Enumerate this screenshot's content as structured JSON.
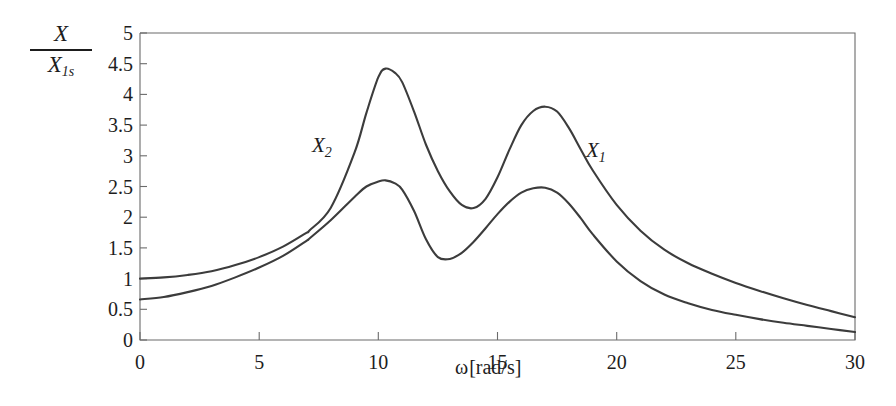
{
  "figure": {
    "ylabel_numerator": "X",
    "ylabel_denominator_base": "X",
    "ylabel_denominator_sub": "1s",
    "xlabel": "ω[rad/s]",
    "xlabel_symbol": "ω",
    "xlabel_unit": "[rad/s]"
  },
  "series_labels": {
    "x1_base": "X",
    "x1_sub": "1",
    "x2_base": "X",
    "x2_sub": "2"
  },
  "chart_data": {
    "type": "line",
    "title": "",
    "xlabel": "ω[rad/s]",
    "ylabel": "X/X1s",
    "xlim": [
      0,
      30
    ],
    "ylim": [
      0,
      5
    ],
    "xticks": [
      0,
      5,
      10,
      15,
      20,
      25,
      30
    ],
    "xtick_labels": [
      "0",
      "5",
      "10",
      "15",
      "20",
      "25",
      "30"
    ],
    "yticks": [
      0,
      0.5,
      1,
      1.5,
      2,
      2.5,
      3,
      3.5,
      4,
      4.5,
      5
    ],
    "ytick_labels": [
      "0",
      "0.5",
      "1",
      "1.5",
      "2",
      "2.5",
      "3",
      "3.5",
      "4",
      "4.5",
      "5"
    ],
    "grid": false,
    "legend": "inline-annotations",
    "line_color": "#3c3c3c",
    "axis_color": "#6b6b6b",
    "annotations": [
      {
        "text": "X2",
        "x": 8.1,
        "y": 3.05,
        "note": "label for upper curve near first resonance"
      },
      {
        "text": "X1",
        "x": 19.5,
        "y": 3.1,
        "note": "label for lower-start curve near second resonance"
      }
    ],
    "series": [
      {
        "name": "X2",
        "note": "upper curve; starts at 1.0, first resonance peak 4.42 at w=10.3, antiresonance dip 2.15 at w=13.5, second peak 3.80 at w=17.0, decays to 0.37 at w=30",
        "x": [
          0,
          1,
          2,
          3,
          4,
          5,
          6,
          7,
          7.1,
          8,
          9,
          9.5,
          10,
          10.3,
          10.7,
          11,
          11.5,
          12,
          12.5,
          13,
          13.5,
          14,
          14.5,
          15,
          15.5,
          16,
          16.5,
          17,
          17.5,
          18,
          18.5,
          19,
          20,
          21,
          22,
          23,
          24,
          25,
          26,
          27,
          28,
          29,
          30
        ],
        "y": [
          1.0,
          1.02,
          1.06,
          1.12,
          1.22,
          1.35,
          1.52,
          1.75,
          1.78,
          2.15,
          3.05,
          3.7,
          4.28,
          4.42,
          4.35,
          4.2,
          3.72,
          3.18,
          2.75,
          2.42,
          2.2,
          2.15,
          2.3,
          2.65,
          3.1,
          3.5,
          3.73,
          3.8,
          3.72,
          3.45,
          3.1,
          2.76,
          2.2,
          1.78,
          1.47,
          1.25,
          1.08,
          0.93,
          0.8,
          0.68,
          0.57,
          0.47,
          0.37
        ]
      },
      {
        "name": "X1",
        "note": "lower curve at first peak; starts at 0.66, first peak 2.60 at w=10.3, valley 1.32 at w=12.5, second peak 2.48 at w=17.0, decays to 0.13 at w=30",
        "x": [
          0,
          1,
          2,
          3,
          4,
          5,
          6,
          7,
          7.1,
          8,
          9,
          9.5,
          10,
          10.3,
          10.7,
          11,
          11.5,
          12,
          12.5,
          13,
          13.5,
          14,
          14.5,
          15,
          15.5,
          16,
          16.5,
          17,
          17.5,
          18,
          18.5,
          19,
          20,
          21,
          22,
          23,
          24,
          25,
          26,
          27,
          28,
          29,
          30
        ],
        "y": [
          0.66,
          0.7,
          0.78,
          0.88,
          1.02,
          1.18,
          1.37,
          1.62,
          1.65,
          1.95,
          2.33,
          2.5,
          2.58,
          2.6,
          2.55,
          2.45,
          2.1,
          1.64,
          1.35,
          1.32,
          1.42,
          1.6,
          1.82,
          2.05,
          2.25,
          2.4,
          2.47,
          2.48,
          2.4,
          2.22,
          1.98,
          1.72,
          1.28,
          0.96,
          0.74,
          0.6,
          0.49,
          0.41,
          0.34,
          0.28,
          0.23,
          0.18,
          0.13
        ]
      }
    ]
  }
}
